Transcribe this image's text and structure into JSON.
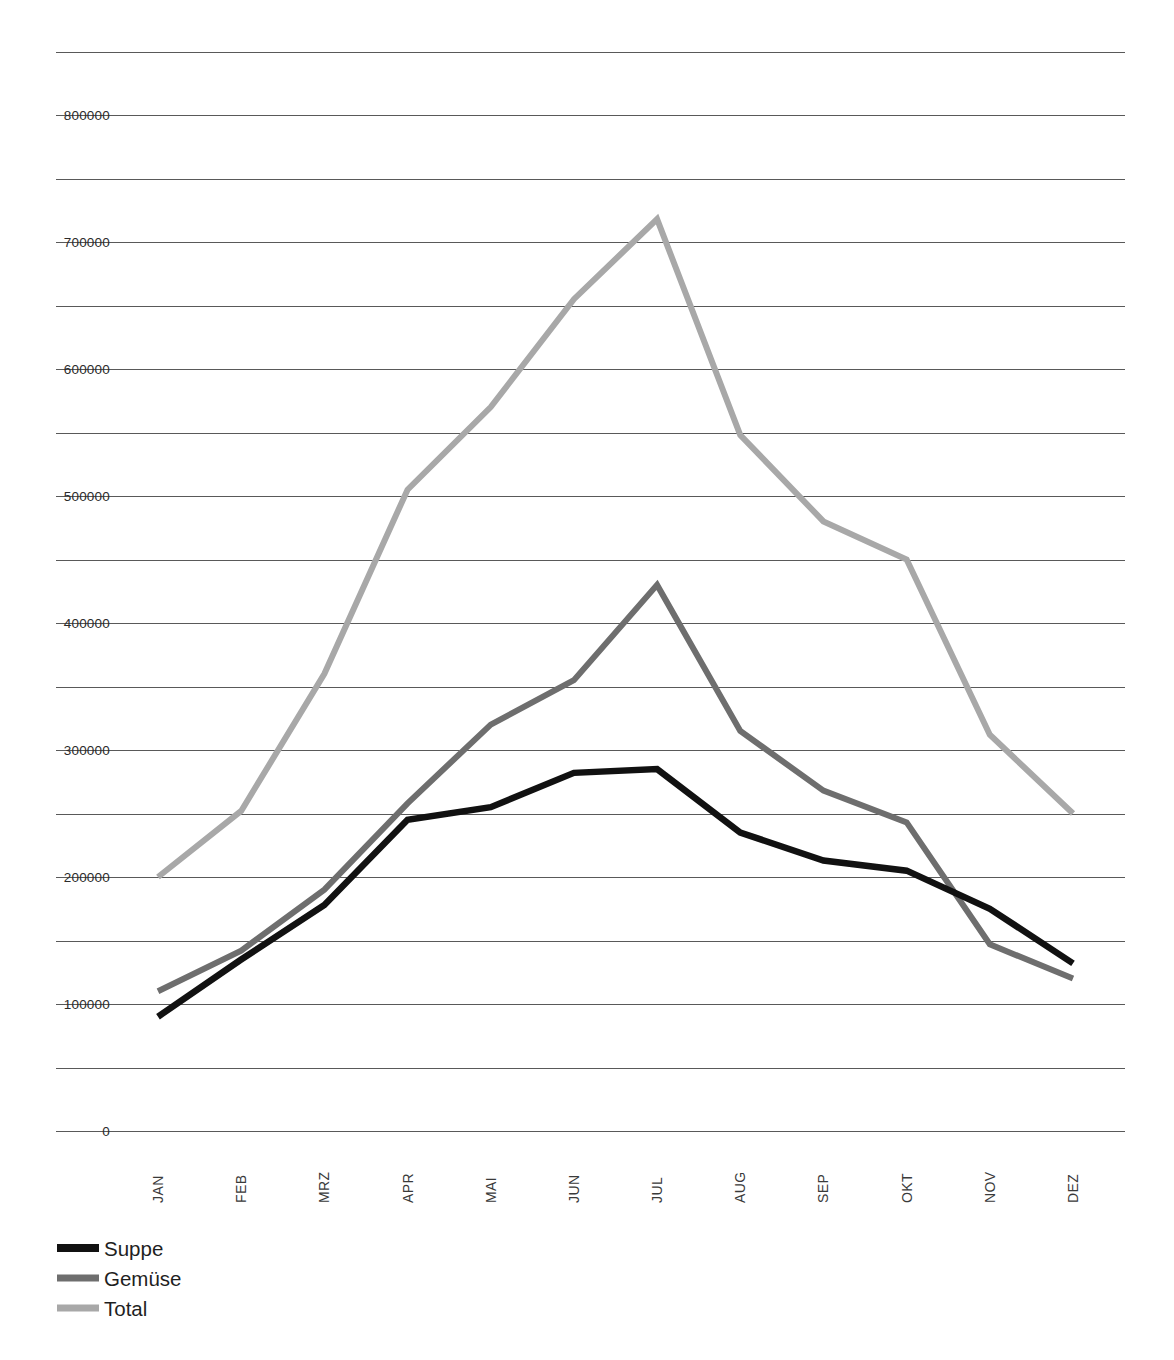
{
  "chart_data": {
    "type": "line",
    "title": "",
    "subtitle": "",
    "xlabel": "",
    "ylabel": "",
    "categories": [
      "JAN",
      "FEB",
      "MRZ",
      "APR",
      "MAI",
      "JUN",
      "JUL",
      "AUG",
      "SEP",
      "OKT",
      "NOV",
      "DEZ"
    ],
    "series": [
      {
        "name": "Suppe",
        "color": "#111111",
        "values": [
          90000,
          135000,
          178000,
          245000,
          255000,
          282000,
          285000,
          235000,
          213000,
          205000,
          175000,
          132000
        ]
      },
      {
        "name": "Gemüse",
        "color": "#6e6e6e",
        "values": [
          110000,
          142000,
          190000,
          258000,
          320000,
          355000,
          430000,
          315000,
          268000,
          243000,
          147000,
          120000
        ]
      },
      {
        "name": "Total",
        "color": "#a8a8a8",
        "values": [
          200000,
          252000,
          360000,
          505000,
          570000,
          655000,
          718000,
          548000,
          480000,
          450000,
          312000,
          250000
        ]
      }
    ],
    "ylim": [
      0,
      850000
    ],
    "y_major_labels": [
      "0",
      "100000",
      "200000",
      "300000",
      "400000",
      "500000",
      "600000",
      "700000",
      "800000"
    ],
    "y_major_values": [
      0,
      100000,
      200000,
      300000,
      400000,
      500000,
      600000,
      700000,
      800000
    ],
    "y_gridline_values": [
      0,
      50000,
      100000,
      150000,
      200000,
      250000,
      300000,
      350000,
      400000,
      450000,
      500000,
      550000,
      600000,
      650000,
      700000,
      750000,
      800000,
      850000
    ],
    "grid": true,
    "grid_color": "#595959",
    "legend_position": "bottom-left",
    "legend": [
      {
        "label": "Suppe",
        "color": "#111111"
      },
      {
        "label": "Gemüse",
        "color": "#6e6e6e"
      },
      {
        "label": "Total",
        "color": "#a8a8a8"
      }
    ]
  }
}
